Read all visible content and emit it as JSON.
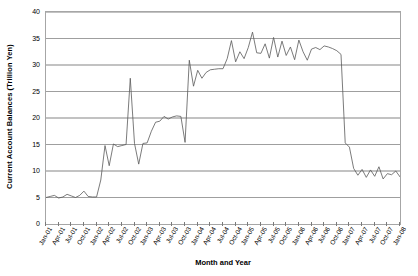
{
  "chart_data": {
    "type": "line",
    "title": "",
    "xlabel": "Month and Year",
    "ylabel": "Current Account Balances (Trillion Yen)",
    "ylim": [
      0,
      40
    ],
    "y_ticks": [
      0,
      5,
      10,
      15,
      20,
      25,
      30,
      35,
      40
    ],
    "grid": true,
    "grid_axis": "y",
    "legend": false,
    "line_color": "#595959",
    "x_tick_labels": [
      "Jan-01",
      "Apr-01",
      "Jul-01",
      "Oct-01",
      "Jan-02",
      "Apr-02",
      "Jul-02",
      "Oct-02",
      "Jan-03",
      "Apr-03",
      "Jul-03",
      "Oct-03",
      "Jan-04",
      "Apr-04",
      "Jul-04",
      "Oct-04",
      "Jan-05",
      "Apr-05",
      "Jul-05",
      "Oct-05",
      "Jan-06",
      "Apr-06",
      "Jul-06",
      "Oct-06",
      "Jan-07",
      "Apr-07",
      "Jul-07",
      "Oct-07",
      "Jan-08"
    ],
    "x_tick_interval_months": 3,
    "x": [
      "Jan-01",
      "Feb-01",
      "Mar-01",
      "Apr-01",
      "May-01",
      "Jun-01",
      "Jul-01",
      "Aug-01",
      "Sep-01",
      "Oct-01",
      "Nov-01",
      "Dec-01",
      "Jan-02",
      "Feb-02",
      "Mar-02",
      "Apr-02",
      "May-02",
      "Jun-02",
      "Jul-02",
      "Aug-02",
      "Sep-02",
      "Oct-02",
      "Nov-02",
      "Dec-02",
      "Jan-03",
      "Feb-03",
      "Mar-03",
      "Apr-03",
      "May-03",
      "Jun-03",
      "Jul-03",
      "Aug-03",
      "Sep-03",
      "Oct-03",
      "Nov-03",
      "Dec-03",
      "Jan-04",
      "Feb-04",
      "Mar-04",
      "Apr-04",
      "May-04",
      "Jun-04",
      "Jul-04",
      "Aug-04",
      "Sep-04",
      "Oct-04",
      "Nov-04",
      "Dec-04",
      "Jan-05",
      "Feb-05",
      "Mar-05",
      "Apr-05",
      "May-05",
      "Jun-05",
      "Jul-05",
      "Aug-05",
      "Sep-05",
      "Oct-05",
      "Nov-05",
      "Dec-05",
      "Jan-06",
      "Feb-06",
      "Mar-06",
      "Apr-06",
      "May-06",
      "Jun-06",
      "Jul-06",
      "Aug-06",
      "Sep-06",
      "Oct-06",
      "Nov-06",
      "Dec-06",
      "Jan-07",
      "Feb-07",
      "Mar-07",
      "Apr-07",
      "May-07",
      "Jun-07",
      "Jul-07",
      "Aug-07",
      "Sep-07",
      "Oct-07",
      "Nov-07",
      "Dec-07",
      "Jan-08"
    ],
    "values": [
      5.0,
      5.2,
      5.4,
      4.9,
      5.1,
      5.6,
      5.3,
      5.0,
      5.4,
      6.2,
      5.2,
      5.1,
      5.1,
      8.3,
      14.8,
      11.0,
      15.1,
      14.6,
      14.8,
      15.0,
      27.5,
      15.2,
      11.3,
      15.2,
      15.3,
      17.5,
      19.2,
      19.4,
      20.3,
      19.8,
      20.2,
      20.4,
      20.3,
      15.4,
      30.9,
      26.0,
      29.0,
      27.5,
      28.6,
      29.1,
      29.2,
      29.3,
      29.3,
      31.2,
      34.6,
      30.6,
      32.5,
      31.2,
      33.3,
      36.2,
      32.3,
      32.2,
      34.0,
      31.3,
      35.2,
      31.5,
      34.5,
      31.8,
      33.4,
      31.0,
      34.7,
      32.5,
      30.9,
      33.0,
      33.3,
      32.9,
      33.6,
      33.4,
      33.1,
      32.7,
      32.0,
      15.3,
      14.5,
      10.5,
      9.2,
      10.3,
      8.8,
      10.2,
      9.0,
      10.8,
      8.5,
      9.5,
      9.3,
      10.0,
      8.9
    ]
  }
}
